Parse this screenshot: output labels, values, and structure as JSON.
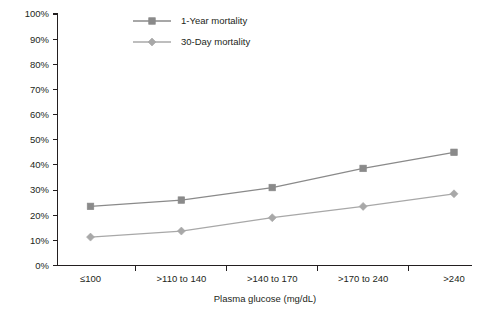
{
  "chart_data": {
    "type": "line",
    "title": "",
    "subtitle": "",
    "xlabel": "Plasma glucose (mg/dL)",
    "ylabel": "",
    "categories": [
      "≤100",
      ">110 to 140",
      ">140 to 170",
      ">170 to 240",
      ">240"
    ],
    "series": [
      {
        "name": "1-Year mortality",
        "marker": "square",
        "color": "#8a8a8a",
        "values": [
          23.5,
          26.0,
          31.0,
          38.6,
          45.0
        ]
      },
      {
        "name": "30-Day mortality",
        "marker": "diamond",
        "color": "#a8a8a8",
        "values": [
          11.3,
          13.7,
          19.0,
          23.5,
          28.5
        ]
      }
    ],
    "ylim": [
      0,
      100
    ],
    "ytick_labels": [
      "0%",
      "10%",
      "20%",
      "30%",
      "40%",
      "50%",
      "60%",
      "70%",
      "80%",
      "90%",
      "100%"
    ],
    "ytick_values": [
      0,
      10,
      20,
      30,
      40,
      50,
      60,
      70,
      80,
      90,
      100
    ],
    "grid": false,
    "legend_position": "top-center",
    "axis_color": "#231f20",
    "background_color": "#ffffff"
  },
  "legend": {
    "entries": [
      {
        "label": "1-Year mortality"
      },
      {
        "label": "30-Day mortality"
      }
    ]
  }
}
